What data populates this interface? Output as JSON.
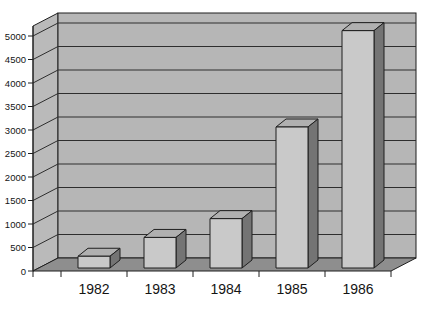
{
  "chart_data": {
    "type": "bar",
    "style": "3d-bar-single-series",
    "title": "",
    "xlabel": "",
    "ylabel": "",
    "categories": [
      "1982",
      "1983",
      "1984",
      "1985",
      "1986"
    ],
    "values": [
      250,
      650,
      1050,
      3000,
      5050
    ],
    "ylim": [
      0,
      5000
    ],
    "ytick_step": 500,
    "ytick_labels": [
      "0",
      "500",
      "1000",
      "1500",
      "2000",
      "2500",
      "3000",
      "3500",
      "4000",
      "4500",
      "5000"
    ],
    "grid": true,
    "legend": false,
    "colors": {
      "background": "#ffffff",
      "back_wall": "#b6b6b6",
      "side_wall": "#bababa",
      "floor": "#8e8e8e",
      "bar_front": "#c9c9c9",
      "bar_top": "#b0b0b0",
      "bar_side": "#747474",
      "gridline": "#2e2e2e",
      "outline": "#1f1f1f",
      "text": "#141414"
    }
  }
}
